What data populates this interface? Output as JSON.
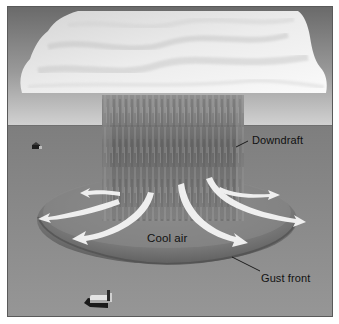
{
  "figure": {
    "type": "illustration",
    "labels": {
      "downdraft": "Downdraft",
      "cool_air": "Cool air",
      "gust_front": "Gust front"
    },
    "elements": {
      "cloud": "cumulonimbus cloud base",
      "rain_shaft": "precipitation column",
      "outflow_arrows": 6,
      "houses": 2
    },
    "colors": {
      "sky_top": "#6e6e6e",
      "sky_horizon": "#cfcfcf",
      "ground": "#8c8c8c",
      "cloud": "#f2f2f2",
      "rain": "#6a6a6a",
      "cool_air_dome": "#7a7a7a",
      "arrow": "#f5f5f5",
      "text": "#111111"
    }
  }
}
